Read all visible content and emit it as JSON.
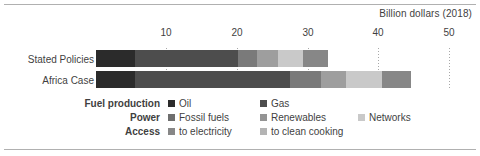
{
  "chart_data": {
    "type": "bar",
    "orientation": "horizontal",
    "stacked": true,
    "title": "",
    "axis_title": "Billion dollars (2018)",
    "xlabel": "Billion dollars (2018)",
    "ylabel": "",
    "xlim": [
      0,
      50
    ],
    "ticks": [
      10,
      20,
      30,
      40,
      50
    ],
    "tick_labels": [
      "10",
      "20",
      "30",
      "40",
      "50"
    ],
    "grid": true,
    "grid_style": "dotted-vertical",
    "legend_position": "bottom",
    "categories": [
      "Stated Policies",
      "Africa Case"
    ],
    "series": [
      {
        "name": "Oil",
        "group": "Fuel production",
        "color": "#2b2b2b",
        "values": [
          5.6,
          5.6
        ]
      },
      {
        "name": "Gas",
        "group": "Fuel production",
        "color": "#4d4d4d",
        "values": [
          14.5,
          21.9
        ]
      },
      {
        "name": "Fossil fuels",
        "group": "Power",
        "color": "#7a7a7a",
        "values": [
          2.7,
          4.4
        ]
      },
      {
        "name": "Renewables",
        "group": "Power",
        "color": "#9e9e9e",
        "values": [
          3.0,
          3.5
        ]
      },
      {
        "name": "Networks",
        "group": "Power",
        "color": "#c9c9c9",
        "values": [
          3.6,
          5.1
        ]
      },
      {
        "name": "to electricity",
        "group": "Access",
        "color": "#878787",
        "values": [
          3.5,
          4.1
        ]
      },
      {
        "name": "to clean cooking",
        "group": "Access",
        "color": "#b4b4b4",
        "values": [
          0.0,
          0.0
        ]
      }
    ],
    "totals": [
      32.9,
      44.6
    ]
  },
  "axis": {
    "title": "Billion dollars (2018)",
    "tick_labels": [
      "10",
      "20",
      "30",
      "40",
      "50"
    ]
  },
  "categories": [
    {
      "label": "Stated Policies"
    },
    {
      "label": "Africa Case"
    }
  ],
  "legend": {
    "groups": [
      {
        "title": "Fuel production",
        "entries": [
          {
            "label": "Oil",
            "color": "#2b2b2b"
          },
          {
            "label": "Gas",
            "color": "#4d4d4d"
          }
        ]
      },
      {
        "title": "Power",
        "entries": [
          {
            "label": "Fossil fuels",
            "color": "#6e6e6e"
          },
          {
            "label": "Renewables",
            "color": "#949494"
          },
          {
            "label": "Networks",
            "color": "#c9c9c9"
          }
        ]
      },
      {
        "title": "Access",
        "entries": [
          {
            "label": "to electricity",
            "color": "#878787"
          },
          {
            "label": "to clean cooking",
            "color": "#b4b4b4"
          }
        ]
      }
    ]
  }
}
